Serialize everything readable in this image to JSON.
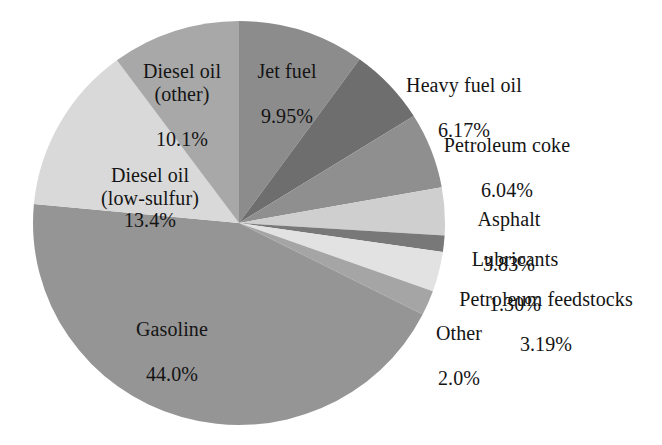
{
  "chart_data": {
    "type": "pie",
    "title": "",
    "subtitle": "",
    "xlabel": "",
    "ylabel": "",
    "legend_position": "none",
    "labels_position": "outside-and-inside",
    "grid": false,
    "units": "percent",
    "start_angle_deg": 0,
    "direction": "clockwise",
    "categories": [
      "Jet fuel",
      "Heavy fuel oil",
      "Petroleum coke",
      "Asphalt",
      "Lubricants",
      "Petroleum feedstocks",
      "Other",
      "Gasoline",
      "Diesel oil (low-sulfur)",
      "Diesel oil (other)"
    ],
    "values": [
      9.95,
      6.17,
      6.04,
      3.83,
      1.3,
      3.19,
      2.0,
      44.0,
      13.4,
      10.1
    ],
    "value_labels": [
      "9.95%",
      "6.17%",
      "6.04%",
      "3.83%",
      "1.30%",
      "3.19%",
      "2.0%",
      "44.0%",
      "13.4%",
      "10.1%"
    ],
    "colors": [
      "#8c8c8c",
      "#6e6e6e",
      "#8f8f8f",
      "#cfcfcf",
      "#787878",
      "#e2e2e2",
      "#a5a5a5",
      "#959595",
      "#d9d9d9",
      "#a8a8a8"
    ],
    "slices": [
      {
        "name": "Jet fuel",
        "value": 9.95,
        "value_label": "9.95%",
        "color": "#8c8c8c"
      },
      {
        "name": "Heavy fuel oil",
        "value": 6.17,
        "value_label": "6.17%",
        "color": "#6e6e6e"
      },
      {
        "name": "Petroleum coke",
        "value": 6.04,
        "value_label": "6.04%",
        "color": "#8f8f8f"
      },
      {
        "name": "Asphalt",
        "value": 3.83,
        "value_label": "3.83%",
        "color": "#cfcfcf"
      },
      {
        "name": "Lubricants",
        "value": 1.3,
        "value_label": "1.30%",
        "color": "#787878"
      },
      {
        "name": "Petroleum feedstocks",
        "value": 3.19,
        "value_label": "3.19%",
        "color": "#e2e2e2"
      },
      {
        "name": "Other",
        "value": 2.0,
        "value_label": "2.0%",
        "color": "#a5a5a5"
      },
      {
        "name": "Gasoline",
        "value": 44.0,
        "value_label": "44.0%",
        "color": "#959595"
      },
      {
        "name": "Diesel oil (low-sulfur)",
        "value": 13.4,
        "value_label": "13.4%",
        "color": "#d9d9d9"
      },
      {
        "name": "Diesel oil (other)",
        "value": 10.1,
        "value_label": "10.1%",
        "color": "#a8a8a8"
      }
    ],
    "total": 100.0
  },
  "labels": {
    "jet_fuel": {
      "name": "Jet fuel",
      "value": "9.95%"
    },
    "diesel_other": {
      "name": "Diesel oil\n(other)",
      "value": "10.1%"
    },
    "diesel_low_sulfur": {
      "name": "Diesel oil\n(low-sulfur)",
      "value": "13.4%"
    },
    "gasoline": {
      "name": "Gasoline",
      "value": "44.0%"
    },
    "heavy_fuel_oil": {
      "name": "Heavy fuel oil",
      "value": "6.17%"
    },
    "petroleum_coke": {
      "name": "Petroleum coke",
      "value": "6.04%"
    },
    "asphalt": {
      "name": "Asphalt",
      "value": "3.83%"
    },
    "lubricants": {
      "name": "Lubricants",
      "value": "1.30%"
    },
    "petroleum_feedstocks": {
      "name": "Petroleum feedstocks",
      "value": "3.19%"
    },
    "other": {
      "name": "Other",
      "value": "2.0%"
    }
  },
  "geometry": {
    "center_x": 239,
    "center_y": 223,
    "radius_x": 206,
    "radius_y": 202
  }
}
